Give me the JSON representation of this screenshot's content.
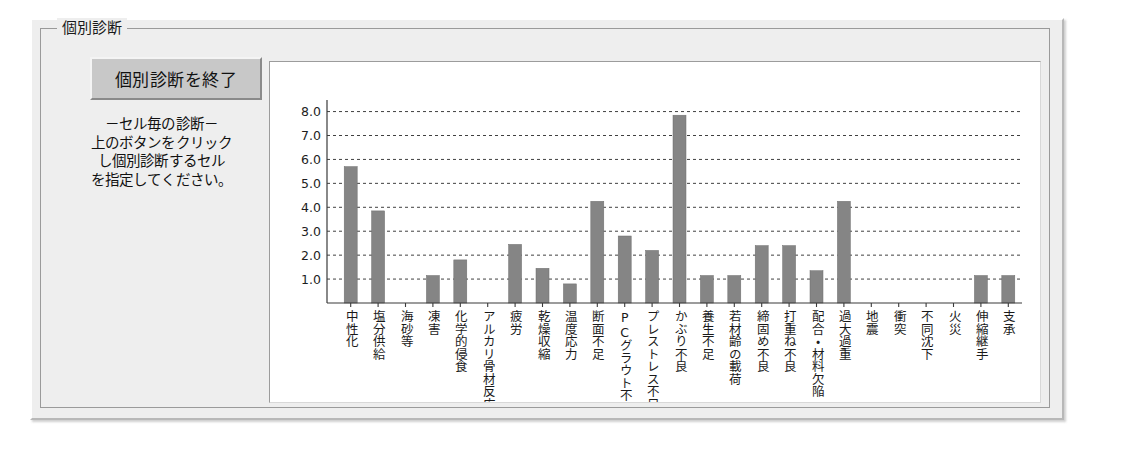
{
  "window": {
    "groupbox_title": "個別診断"
  },
  "controls": {
    "end_button_label": "個別診断を終了",
    "hint_text": "－セル毎の診断－\n上のボタンをクリック\nし個別診断するセル\nを指定してください。"
  },
  "colors": {
    "bar_fill": "#858585",
    "bar_stroke": "#6e6e6e",
    "grid": "#404040",
    "axis": "#3a3a3a",
    "panel_bg": "#ffffff",
    "window_bg": "#eeeeee",
    "button_face": "#c8c8c8",
    "text": "#1a1a1a"
  },
  "chart_data": {
    "type": "bar",
    "title": "",
    "xlabel": "",
    "ylabel": "",
    "ylim": [
      0,
      8.4
    ],
    "grid": true,
    "legend": "none",
    "yticks": [
      "1.0",
      "2.0",
      "3.0",
      "4.0",
      "5.0",
      "6.0",
      "7.0",
      "8.0"
    ],
    "ytick_values": [
      1.0,
      2.0,
      3.0,
      4.0,
      5.0,
      6.0,
      7.0,
      8.0
    ],
    "categories": [
      "中性化",
      "塩分供給",
      "海砂等",
      "凍害",
      "化学的侵食",
      "アルカリ骨材反応",
      "疲労",
      "乾燥収縮",
      "温度応力",
      "断面不足",
      "PCグラウト不良",
      "プレストレス不足",
      "かぶり不良",
      "養生不足",
      "若材齢の載荷",
      "締固め不良",
      "打重ね不良",
      "配合・材料欠陥",
      "過大過重",
      "地震",
      "衝突",
      "不同沈下",
      "火災",
      "伸縮継手",
      "支承"
    ],
    "values": [
      5.7,
      3.85,
      0.0,
      1.15,
      1.8,
      0.0,
      2.45,
      1.45,
      0.8,
      4.25,
      2.8,
      2.2,
      7.85,
      1.15,
      1.15,
      2.4,
      2.4,
      1.35,
      4.25,
      0.0,
      0.0,
      0.0,
      0.0,
      1.15,
      1.15
    ]
  }
}
